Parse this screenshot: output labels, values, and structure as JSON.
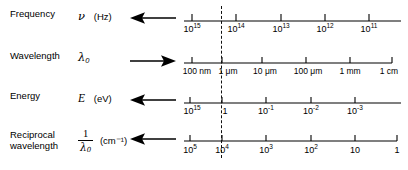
{
  "figure": {
    "type": "scale-alignment-diagram",
    "axis": {
      "x_start": 192,
      "x_end": 399,
      "tick_spacing": 44.3,
      "line_color": "#000000"
    },
    "alignment_line": {
      "x": 221,
      "style": "dashed",
      "aligned_values": [
        "10¹⁴ Hz",
        "1 μm",
        "1 eV",
        "10⁴ cm⁻¹"
      ]
    }
  },
  "rows": [
    {
      "id": "frequency",
      "name": "Frequency",
      "symbol": "ν",
      "symbol_sub": "",
      "unit": "(Hz)",
      "arrow_direction": "left",
      "ticks": [
        {
          "label": "10¹⁵",
          "base": "10",
          "exp": "15",
          "x": 192
        },
        {
          "label": "10¹⁴",
          "base": "10",
          "exp": "14",
          "x": 236
        },
        {
          "label": "10¹³",
          "base": "10",
          "exp": "13",
          "x": 281
        },
        {
          "label": "10¹²",
          "base": "10",
          "exp": "12",
          "x": 325
        },
        {
          "label": "10¹¹",
          "base": "10",
          "exp": "11",
          "x": 369
        }
      ],
      "axis_end_tick": false
    },
    {
      "id": "wavelength",
      "name": "Wavelength",
      "symbol": "λ",
      "symbol_sub": "0",
      "unit": "",
      "arrow_direction": "right",
      "ticks": [
        {
          "label": "100 nm",
          "base": "",
          "exp": "",
          "x": 192
        },
        {
          "label": "1 μm",
          "base": "",
          "exp": "",
          "x": 222
        },
        {
          "label": "10 μm",
          "base": "",
          "exp": "",
          "x": 262
        },
        {
          "label": "100 μm",
          "base": "",
          "exp": "",
          "x": 306
        },
        {
          "label": "1 mm",
          "base": "",
          "exp": "",
          "x": 350
        },
        {
          "label": "1 cm",
          "base": "",
          "exp": "",
          "x": 392
        }
      ],
      "axis_end_tick": true
    },
    {
      "id": "energy",
      "name": "Energy",
      "symbol": "E",
      "symbol_sub": "",
      "unit": "(eV)",
      "arrow_direction": "left",
      "ticks": [
        {
          "label": "10¹⁵",
          "base": "10",
          "exp": "15",
          "x": 190
        },
        {
          "label": "1",
          "base": "1",
          "exp": "",
          "x": 222
        },
        {
          "label": "10⁻¹",
          "base": "10",
          "exp": "-1",
          "x": 266
        },
        {
          "label": "10⁻²",
          "base": "10",
          "exp": "-2",
          "x": 311
        },
        {
          "label": "10⁻³",
          "base": "10",
          "exp": "-3",
          "x": 355
        }
      ],
      "axis_end_tick": false
    },
    {
      "id": "reciprocal-wavelength",
      "name": "Reciprocal\nwavelength",
      "symbol": "1/λ",
      "symbol_sub": "0",
      "unit": "(cm⁻¹)",
      "arrow_direction": "left",
      "ticks": [
        {
          "label": "10⁵",
          "base": "10",
          "exp": "5",
          "x": 190
        },
        {
          "label": "10⁴",
          "base": "10",
          "exp": "4",
          "x": 222
        },
        {
          "label": "10³",
          "base": "10",
          "exp": "3",
          "x": 266
        },
        {
          "label": "10²",
          "base": "10",
          "exp": "2",
          "x": 311
        },
        {
          "label": "10",
          "base": "10",
          "exp": "",
          "x": 355
        },
        {
          "label": "1",
          "base": "1",
          "exp": "",
          "x": 397
        }
      ],
      "axis_end_tick": true
    }
  ],
  "fraction": {
    "numerator": "1",
    "denominator": "λ",
    "denominator_sub": "0"
  }
}
